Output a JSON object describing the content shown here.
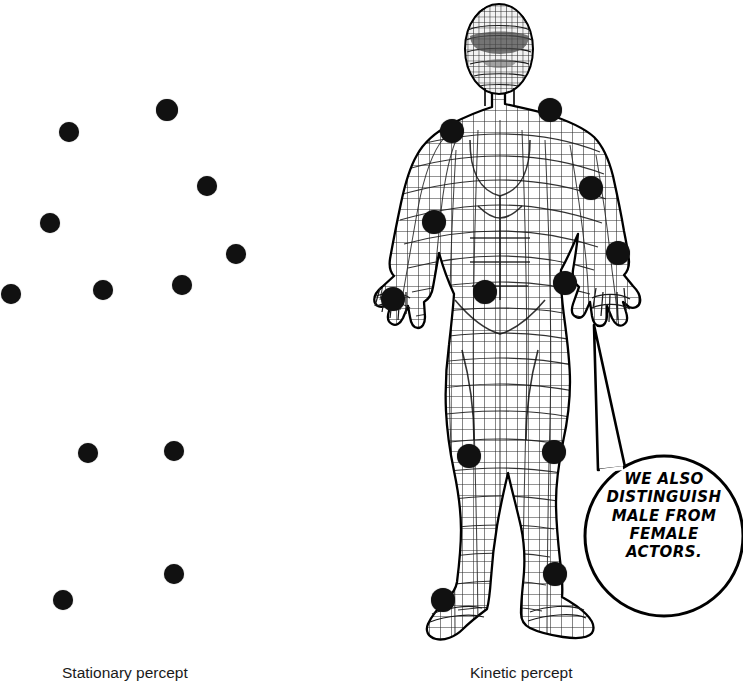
{
  "figure": {
    "background_color": "#ffffff",
    "dot_color": "#111111",
    "line_color": "#000000"
  },
  "panels": {
    "stationary": {
      "caption": "Stationary percept",
      "description": "A sparse array of isolated black dots with no visible body form",
      "dot_count": 12,
      "dots": [
        {
          "name": "dot-head",
          "x": 167,
          "y": 110,
          "r": 11
        },
        {
          "name": "dot-shoulder-left",
          "x": 69,
          "y": 132,
          "r": 10
        },
        {
          "name": "dot-shoulder-right",
          "x": 207,
          "y": 186,
          "r": 10
        },
        {
          "name": "dot-elbow-left",
          "x": 50,
          "y": 223,
          "r": 10
        },
        {
          "name": "dot-elbow-right",
          "x": 236,
          "y": 254,
          "r": 10
        },
        {
          "name": "dot-wrist-left",
          "x": 11,
          "y": 294,
          "r": 10
        },
        {
          "name": "dot-hip-left",
          "x": 103,
          "y": 290,
          "r": 10
        },
        {
          "name": "dot-hip-right",
          "x": 182,
          "y": 285,
          "r": 10
        },
        {
          "name": "dot-knee-left",
          "x": 88,
          "y": 453,
          "r": 10
        },
        {
          "name": "dot-knee-right",
          "x": 174,
          "y": 451,
          "r": 10
        },
        {
          "name": "dot-ankle-right",
          "x": 174,
          "y": 574,
          "r": 10
        },
        {
          "name": "dot-ankle-left",
          "x": 63,
          "y": 600,
          "r": 10
        }
      ]
    },
    "kinetic": {
      "caption": "Kinetic percept",
      "description": "A standing wireframe-mesh human figure with the same markers placed on its joints",
      "dot_count": 12,
      "dots": [
        {
          "name": "dot-shoulder-right",
          "x": 550,
          "y": 110,
          "r": 12
        },
        {
          "name": "dot-shoulder-left",
          "x": 452,
          "y": 131,
          "r": 12
        },
        {
          "name": "dot-elbow-right",
          "x": 591,
          "y": 188,
          "r": 12
        },
        {
          "name": "dot-elbow-left",
          "x": 434,
          "y": 222,
          "r": 12
        },
        {
          "name": "dot-wrist-right",
          "x": 618,
          "y": 253,
          "r": 12
        },
        {
          "name": "dot-hip-right",
          "x": 565,
          "y": 283,
          "r": 12
        },
        {
          "name": "dot-hip-left",
          "x": 485,
          "y": 292,
          "r": 12
        },
        {
          "name": "dot-wrist-left",
          "x": 393,
          "y": 299,
          "r": 12
        },
        {
          "name": "dot-knee-right",
          "x": 554,
          "y": 452,
          "r": 12
        },
        {
          "name": "dot-knee-left",
          "x": 469,
          "y": 456,
          "r": 12
        },
        {
          "name": "dot-ankle-right",
          "x": 555,
          "y": 574,
          "r": 12
        },
        {
          "name": "dot-ankle-left",
          "x": 443,
          "y": 600,
          "r": 12
        }
      ]
    }
  },
  "speech_bubble": {
    "lines": [
      "WE ALSO",
      "DISTINGUISH",
      "MALE FROM",
      "FEMALE",
      "ACTORS."
    ],
    "full_text": "WE ALSO DISTINGUISH MALE FROM FEMALE ACTORS.",
    "shape": "ellipse",
    "tail": "pointer tail rising up-left toward the figure's hip",
    "center_x": 664,
    "center_y": 536,
    "radius_x": 79,
    "radius_y": 80
  }
}
